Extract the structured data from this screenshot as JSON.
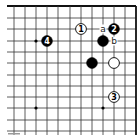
{
  "diagram": {
    "type": "go-board-fragment",
    "corner": "top-right",
    "grid": {
      "cols_x": [
        14,
        25,
        36,
        47,
        58,
        70,
        81,
        92,
        103,
        114,
        125,
        136
      ],
      "rows_y": [
        6,
        18,
        29,
        41,
        52,
        63,
        75,
        86,
        97,
        108,
        120,
        131
      ],
      "line_color": "#333333",
      "edge_color": "#111111"
    },
    "star_points": [
      {
        "x": 36,
        "y": 41
      },
      {
        "x": 36,
        "y": 108
      },
      {
        "x": 103,
        "y": 108
      }
    ],
    "stones": [
      {
        "id": "stone-1",
        "color": "white",
        "x": 81,
        "y": 29,
        "label": "1"
      },
      {
        "id": "stone-2",
        "color": "black",
        "x": 114,
        "y": 29,
        "label": "2"
      },
      {
        "id": "stone-3",
        "color": "white",
        "x": 114,
        "y": 97,
        "label": "3"
      },
      {
        "id": "stone-4",
        "color": "black",
        "x": 47,
        "y": 41,
        "label": "4"
      },
      {
        "id": "stone-black-a",
        "color": "black",
        "x": 103,
        "y": 41,
        "label": ""
      },
      {
        "id": "stone-black-b",
        "color": "black",
        "x": 92,
        "y": 63,
        "label": ""
      },
      {
        "id": "stone-white-c",
        "color": "white",
        "x": 114,
        "y": 63,
        "label": ""
      }
    ],
    "marks": [
      {
        "id": "mark-a",
        "text": "a",
        "x": 103,
        "y": 29
      },
      {
        "id": "mark-b",
        "text": "b",
        "x": 114,
        "y": 41
      }
    ]
  }
}
